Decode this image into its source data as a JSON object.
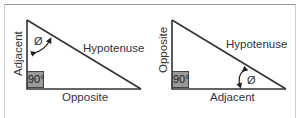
{
  "colors": {
    "line": "#333333",
    "right_angle_fill": "#9a9a9a",
    "frame": "#9a9a9a",
    "text": "#333333"
  },
  "diagrams": [
    {
      "name": "angle-at-top",
      "sides": {
        "vertical": "Adjacent",
        "horizontal": "Opposite",
        "diagonal": "Hypotenuse"
      },
      "right_angle": "90°",
      "angle_symbol": "Ø"
    },
    {
      "name": "angle-at-bottom-right",
      "sides": {
        "vertical": "Opposite",
        "horizontal": "Adjacent",
        "diagonal": "Hypotenuse"
      },
      "right_angle": "90°",
      "angle_symbol": "Ø"
    }
  ]
}
